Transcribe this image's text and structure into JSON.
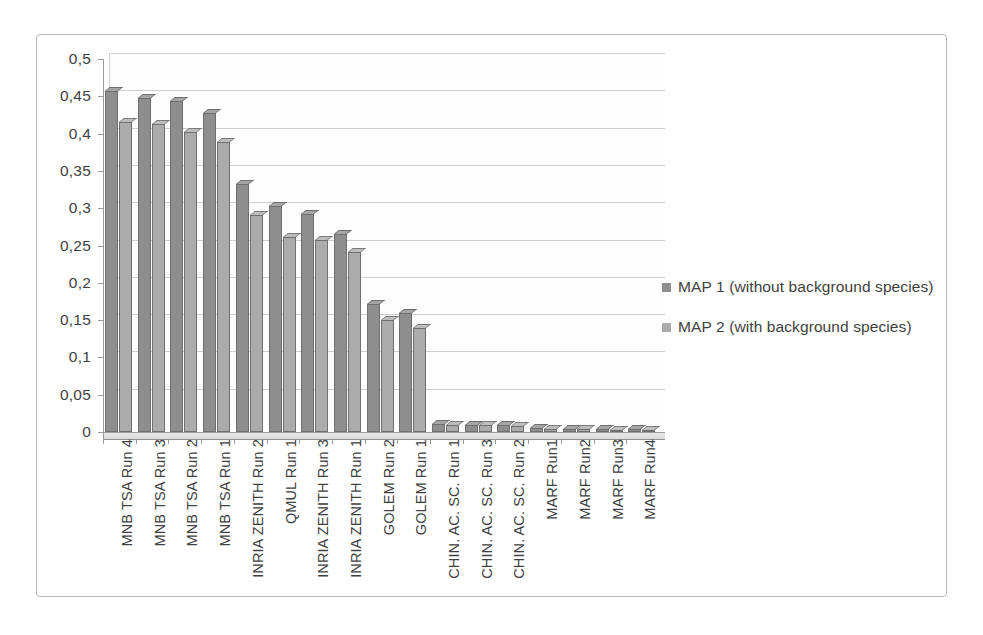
{
  "chart_data": {
    "type": "bar",
    "title": "",
    "xlabel": "",
    "ylabel": "",
    "ylim": [
      0,
      0.5
    ],
    "grid": true,
    "legend_position": "right",
    "y_ticks": [
      "0",
      "0,05",
      "0,1",
      "0,15",
      "0,2",
      "0,25",
      "0,3",
      "0,35",
      "0,4",
      "0,45",
      "0,5"
    ],
    "y_tick_values": [
      0,
      0.05,
      0.1,
      0.15,
      0.2,
      0.25,
      0.3,
      0.35,
      0.4,
      0.45,
      0.5
    ],
    "decimal_separator": ",",
    "categories": [
      "MNB TSA Run 4",
      "MNB TSA Run 3",
      "MNB TSA Run 2",
      "MNB TSA Run 1",
      "INRIA ZENITH Run 2",
      "QMUL Run 1",
      "INRIA ZENITH Run 3",
      "INRIA ZENITH Run 1",
      "GOLEM Run 2",
      "GOLEM Run 1",
      "CHIN. AC. SC. Run 1",
      "CHIN. AC. SC. Run 3",
      "CHIN. AC. SC. Run 2",
      "MARF Run1",
      "MARF Run2",
      "MARF Run3",
      "MARF Run4"
    ],
    "series": [
      {
        "name": "MAP 1 (without background species)",
        "color": "#8e8e8e",
        "values": [
          0.457,
          0.448,
          0.444,
          0.427,
          0.332,
          0.303,
          0.292,
          0.265,
          0.172,
          0.16,
          0.011,
          0.01,
          0.009,
          0.005,
          0.004,
          0.004,
          0.004
        ]
      },
      {
        "name": "MAP 2 (with background species)",
        "color": "#ababab",
        "values": [
          0.415,
          0.413,
          0.402,
          0.389,
          0.291,
          0.262,
          0.257,
          0.241,
          0.15,
          0.139,
          0.01,
          0.009,
          0.008,
          0.004,
          0.004,
          0.003,
          0.003
        ]
      }
    ]
  },
  "legend": {
    "entries": [
      {
        "label": "MAP 1 (without background species)",
        "color": "#8e8e8e"
      },
      {
        "label": "MAP 2 (with background species)",
        "color": "#ababab"
      }
    ]
  }
}
